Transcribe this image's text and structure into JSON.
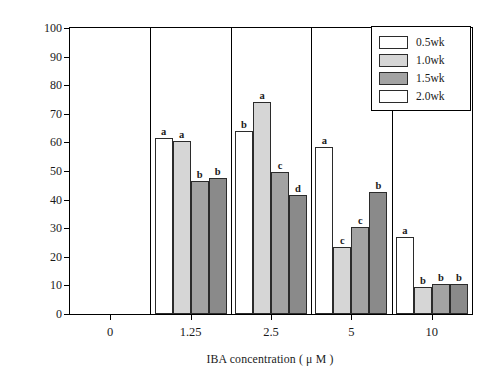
{
  "chart_data": {
    "type": "bar",
    "title": "",
    "xlabel": "IBA concentration ( μ M )",
    "ylabel": "Rooting percentages ( % )",
    "categories": [
      "0",
      "1.25",
      "2.5",
      "5",
      "10"
    ],
    "ylim": [
      0,
      100
    ],
    "yticks": [
      0,
      10,
      20,
      30,
      40,
      50,
      60,
      70,
      80,
      90,
      100
    ],
    "grid": false,
    "legend_position": "top-right",
    "series": [
      {
        "name": "0.5wk",
        "color": "#ffffff",
        "values": [
          0,
          61.5,
          64,
          58.5,
          27
        ],
        "labels": [
          "",
          "a",
          "b",
          "a",
          "a"
        ]
      },
      {
        "name": "1.0wk",
        "color": "#d6d6d6",
        "values": [
          0,
          60.5,
          74,
          23.5,
          9.5
        ],
        "labels": [
          "",
          "a",
          "a",
          "c",
          "b"
        ]
      },
      {
        "name": "1.5wk",
        "color": "#a3a3a3",
        "values": [
          0,
          46.5,
          49.5,
          30.5,
          10.5
        ],
        "labels": [
          "",
          "b",
          "c",
          "c",
          "b"
        ]
      },
      {
        "name": "2.0wk",
        "color": "#8a8a8a",
        "values": [
          0,
          47.5,
          41.5,
          42.5,
          10.5
        ],
        "labels": [
          "",
          "b",
          "d",
          "b",
          "b"
        ]
      }
    ]
  },
  "legend": {
    "entries": [
      {
        "label": "0.5wk",
        "swatch": "#ffffff"
      },
      {
        "label": "1.0wk",
        "swatch": "#d6d6d6"
      },
      {
        "label": "1.5wk",
        "swatch": "#a3a3a3"
      },
      {
        "label": "2.0wk",
        "swatch": "#ffffff"
      }
    ]
  },
  "axes": {
    "y_title": "Rooting percentages ( % )",
    "x_title": "IBA concentration ( μ M )",
    "y_tick_labels": [
      "100",
      "90",
      "80",
      "70",
      "60",
      "50",
      "40",
      "30",
      "20",
      "10",
      "0"
    ],
    "x_tick_labels": [
      "0",
      "1.25",
      "2.5",
      "5",
      "10"
    ]
  }
}
